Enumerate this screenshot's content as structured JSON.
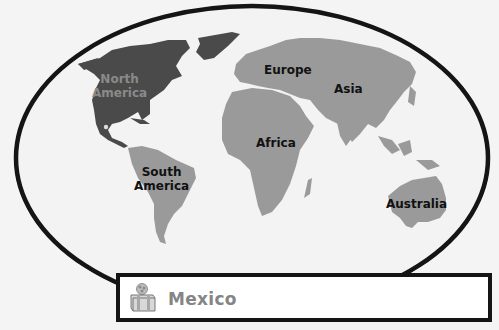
{
  "map": {
    "type": "world-continents",
    "highlighted_continent": "North America",
    "marker_location": "Mexico",
    "colors": {
      "ocean": "#f2f2f2",
      "land": "#9a9a9a",
      "highlight": "#4a4a4a",
      "border": "#151515"
    },
    "labels": [
      {
        "id": "north-america",
        "text": "North\nAmerica",
        "highlighted": true
      },
      {
        "id": "europe",
        "text": "Europe"
      },
      {
        "id": "asia",
        "text": "Asia"
      },
      {
        "id": "africa",
        "text": "Africa"
      },
      {
        "id": "south-america",
        "text": "South\nAmerica"
      },
      {
        "id": "australia",
        "text": "Australia"
      }
    ]
  },
  "answer": {
    "icon": "gift-box-icon",
    "text": "Mexico"
  }
}
